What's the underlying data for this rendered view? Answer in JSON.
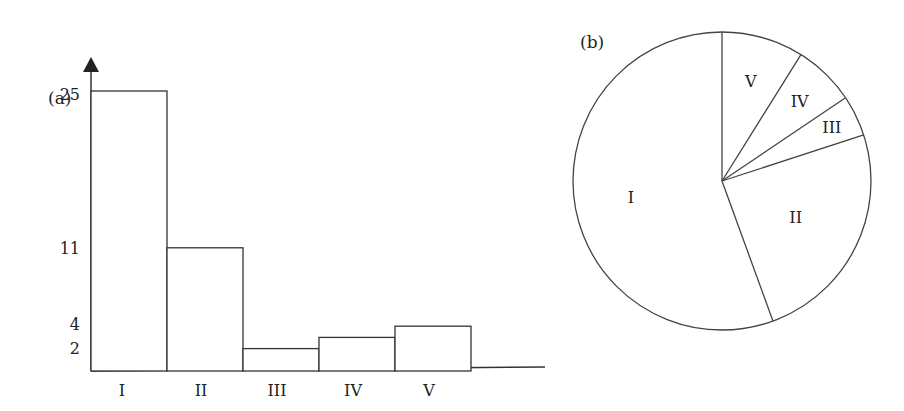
{
  "chart_data": [
    {
      "type": "bar",
      "panel_label": "(a)",
      "categories": [
        "I",
        "II",
        "III",
        "IV",
        "V"
      ],
      "values": [
        25,
        11,
        2,
        3,
        4
      ],
      "yticks": [
        2,
        4,
        11,
        25
      ],
      "ylim": [
        0,
        26
      ],
      "xlabel": "",
      "ylabel": "",
      "grid": false
    },
    {
      "type": "pie",
      "panel_label": "(b)",
      "categories": [
        "I",
        "II",
        "III",
        "IV",
        "V"
      ],
      "values": [
        25,
        11,
        2,
        3,
        4
      ]
    }
  ],
  "labels": {
    "a": "(a)",
    "b": "(b)"
  }
}
